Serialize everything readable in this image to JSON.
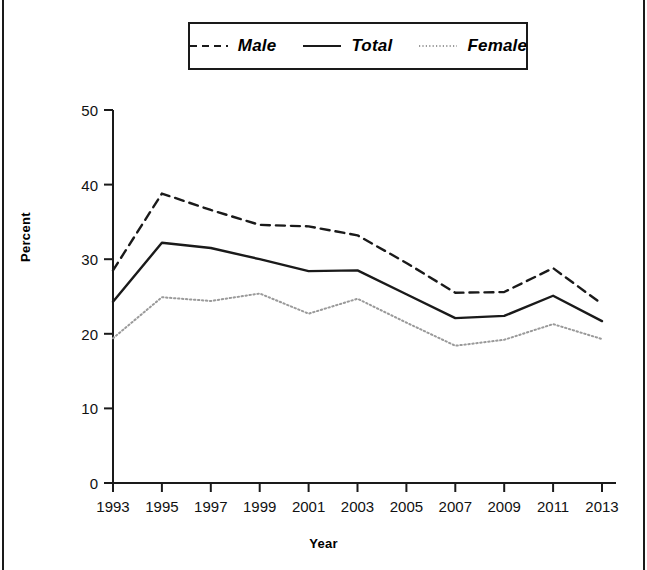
{
  "figure": {
    "legend": {
      "entries": [
        {
          "label": "Male",
          "style": "dashed",
          "color": "#1a1a1a"
        },
        {
          "label": "Total",
          "style": "solid",
          "color": "#1a1a1a"
        },
        {
          "label": "Female",
          "style": "dotted",
          "color": "#9a9a9a"
        }
      ]
    }
  },
  "chart_data": {
    "type": "line",
    "title": "",
    "xlabel": "Year",
    "ylabel": "Percent",
    "x": [
      1993,
      1995,
      1997,
      1999,
      2001,
      2003,
      2005,
      2007,
      2009,
      2011,
      2013
    ],
    "categories": [
      "1993",
      "1995",
      "1997",
      "1999",
      "2001",
      "2003",
      "2005",
      "2007",
      "2009",
      "2011",
      "2013"
    ],
    "xlim": [
      1993,
      2013
    ],
    "ylim": [
      0,
      50
    ],
    "yticks": [
      0,
      10,
      20,
      30,
      40,
      50
    ],
    "ytick_labels": [
      "0",
      "10",
      "20",
      "30",
      "40",
      "50"
    ],
    "grid": false,
    "legend_position": "top-center",
    "series": [
      {
        "name": "Male",
        "style": "dashed",
        "color": "#1a1a1a",
        "values": [
          28.5,
          38.8,
          36.6,
          34.6,
          34.4,
          33.2,
          29.5,
          25.5,
          25.6,
          28.8,
          24.0
        ]
      },
      {
        "name": "Total",
        "style": "solid",
        "color": "#1a1a1a",
        "values": [
          24.3,
          32.2,
          31.5,
          30.0,
          28.4,
          28.5,
          25.3,
          22.1,
          22.4,
          25.1,
          21.7
        ]
      },
      {
        "name": "Female",
        "style": "dotted",
        "color": "#9a9a9a",
        "values": [
          19.4,
          24.9,
          24.4,
          25.4,
          22.7,
          24.7,
          21.5,
          18.4,
          19.2,
          21.3,
          19.3
        ]
      }
    ]
  }
}
